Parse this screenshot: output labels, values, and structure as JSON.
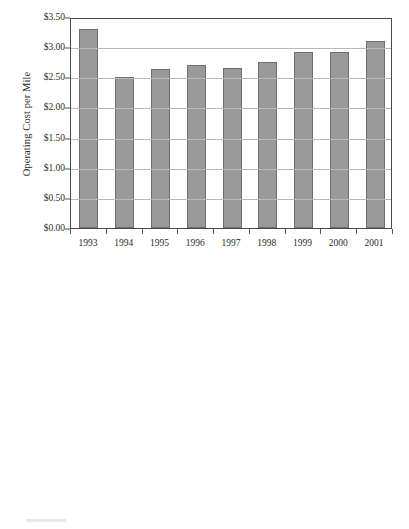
{
  "page": {
    "background_color": "#ffffff",
    "bar_fill_color": "#9a9a9a",
    "bar_border_color": "#6e6e6e",
    "gridline_color": "#b9b9b9",
    "axis_color": "#4a4a4a",
    "text_color": "#2b2b2b"
  },
  "chart_data": [
    {
      "type": "bar",
      "id": "operating-cost-per-mile",
      "title": "",
      "xlabel": "",
      "ylabel": "Operating Cost per Mile",
      "categories": [
        "1993",
        "1994",
        "1995",
        "1996",
        "1997",
        "1998",
        "1999",
        "2000",
        "2001"
      ],
      "values": [
        3.3,
        2.5,
        2.64,
        2.71,
        2.66,
        2.75,
        2.92,
        2.92,
        3.1
      ],
      "ylim": [
        0,
        3.5
      ],
      "ytick_values": [
        0,
        0.5,
        1.0,
        1.5,
        2.0,
        2.5,
        3.0,
        3.5
      ],
      "ytick_labels": [
        "$0.00",
        "$0.50",
        "$1.00",
        "$1.50",
        "$2.00",
        "$2.50",
        "$3.00",
        "$3.50"
      ],
      "grid": true,
      "grid_axis": "y",
      "legend": false,
      "legend_position": "none"
    },
    {
      "type": "bar",
      "id": "operating-cost-per-hour",
      "title": "",
      "xlabel": "",
      "ylabel": "Operating Cost per Hour",
      "categories": [
        "1993",
        "1994",
        "1995",
        "1996",
        "1997",
        "1998",
        "1999",
        "2000",
        "2001"
      ],
      "values": [
        30.7,
        31.0,
        32.0,
        33.1,
        33.6,
        34.4,
        36.1,
        36.4,
        39.3
      ],
      "ylim": [
        0,
        45
      ],
      "ytick_values": [
        0,
        5,
        10,
        15,
        20,
        25,
        30,
        35,
        40,
        45
      ],
      "ytick_labels": [
        "$0.00",
        "$5.00",
        "$10.00",
        "$15.00",
        "$20.00",
        "$25.00",
        "$30.00",
        "$35.00",
        "$40.00",
        "$45.00"
      ],
      "grid": true,
      "grid_axis": "y",
      "legend": false,
      "legend_position": "none"
    }
  ]
}
